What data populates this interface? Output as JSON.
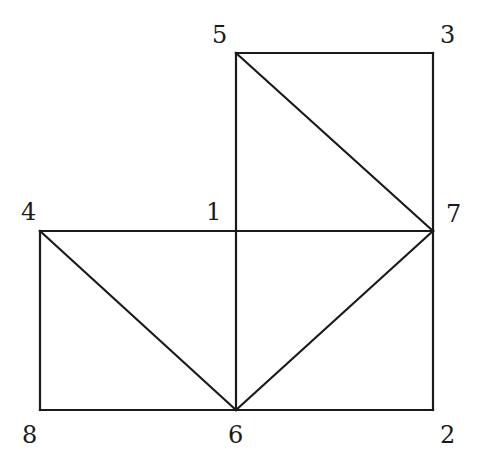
{
  "diagram": {
    "type": "graph",
    "stroke_color": "#1a1a1a",
    "background": "#ffffff",
    "nodes": [
      {
        "id": "1",
        "label": "1",
        "x": 236,
        "y": 231,
        "label_x": 206,
        "label_y": 220
      },
      {
        "id": "2",
        "label": "2",
        "x": 433,
        "y": 410,
        "label_x": 440,
        "label_y": 443
      },
      {
        "id": "3",
        "label": "3",
        "x": 433,
        "y": 53,
        "label_x": 440,
        "label_y": 43
      },
      {
        "id": "4",
        "label": "4",
        "x": 40,
        "y": 231,
        "label_x": 21,
        "label_y": 220
      },
      {
        "id": "5",
        "label": "5",
        "x": 236,
        "y": 53,
        "label_x": 212,
        "label_y": 43
      },
      {
        "id": "6",
        "label": "6",
        "x": 236,
        "y": 410,
        "label_x": 228,
        "label_y": 443
      },
      {
        "id": "7",
        "label": "7",
        "x": 433,
        "y": 231,
        "label_x": 446,
        "label_y": 222
      },
      {
        "id": "8",
        "label": "8",
        "x": 40,
        "y": 410,
        "label_x": 22,
        "label_y": 443
      }
    ],
    "edges": [
      {
        "from": "5",
        "to": "3"
      },
      {
        "from": "3",
        "to": "7"
      },
      {
        "from": "5",
        "to": "7"
      },
      {
        "from": "5",
        "to": "1"
      },
      {
        "from": "1",
        "to": "6"
      },
      {
        "from": "4",
        "to": "1"
      },
      {
        "from": "1",
        "to": "7"
      },
      {
        "from": "7",
        "to": "2"
      },
      {
        "from": "4",
        "to": "8"
      },
      {
        "from": "8",
        "to": "6"
      },
      {
        "from": "6",
        "to": "2"
      },
      {
        "from": "4",
        "to": "6"
      },
      {
        "from": "6",
        "to": "7"
      }
    ]
  }
}
